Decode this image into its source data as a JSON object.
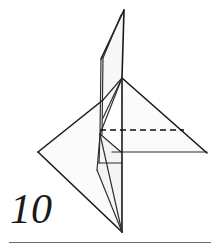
{
  "figure": {
    "step_label": "10",
    "colors": {
      "stroke": "#1a1a1a",
      "stroke_light": "#3a3a3a",
      "fill_front": "#fafafa",
      "fill_back": "#f2f2f2",
      "fill_flap": "#f7f7f7",
      "rule": "#6b6b6b",
      "background": "#ffffff"
    },
    "line_styles": {
      "solid": "edge",
      "dashed": "valley-fold"
    },
    "points": {
      "spike_tip": [
        124,
        10
      ],
      "spike_left_low": [
        101,
        59
      ],
      "apex": [
        122,
        78
      ],
      "right_tip": [
        207,
        153
      ],
      "left_tip": [
        38,
        152
      ],
      "bottom_tip": [
        122,
        232
      ],
      "inner_node": [
        100,
        134
      ],
      "inner_node_low": [
        100,
        163
      ],
      "mid_node": [
        103,
        118
      ],
      "base_right_end": [
        207,
        152
      ],
      "dashed_left": [
        100,
        130
      ],
      "dashed_right": [
        184,
        130
      ]
    },
    "shapes": [
      {
        "name": "upper-spike-flap",
        "type": "polygon",
        "fill": "fill_flap",
        "points": "124,10 101,59 100,134 103,118 122,78"
      },
      {
        "name": "right-wing-triangle",
        "type": "polygon",
        "fill": "fill_front",
        "points": "122,78 207,152 118,152"
      },
      {
        "name": "left-wing-triangle",
        "type": "polygon",
        "fill": "fill_front",
        "points": "38,152 103,100 122,232"
      },
      {
        "name": "lower-center-flap",
        "type": "polygon",
        "fill": "fill_back",
        "points": "100,134 122,152 122,232 97,170"
      }
    ],
    "edges": [
      {
        "name": "spike-right-edge",
        "from": [
          124,
          10
        ],
        "to": [
          122,
          78
        ]
      },
      {
        "name": "spike-left-edge",
        "from": [
          124,
          10
        ],
        "to": [
          101,
          59
        ]
      },
      {
        "name": "spike-left-inner",
        "from": [
          121,
          14
        ],
        "to": [
          103,
          58
        ]
      },
      {
        "name": "flap-left-vertical",
        "from": [
          101,
          59
        ],
        "to": [
          100,
          134
        ]
      },
      {
        "name": "flap-left-vertical-inner",
        "from": [
          103,
          58
        ],
        "to": [
          102,
          134
        ]
      },
      {
        "name": "center-vertical",
        "from": [
          122,
          78
        ],
        "to": [
          122,
          232
        ]
      },
      {
        "name": "apex-to-right-tip",
        "from": [
          122,
          78
        ],
        "to": [
          207,
          153
        ]
      },
      {
        "name": "apex-to-inner-node",
        "from": [
          122,
          78
        ],
        "to": [
          100,
          134
        ]
      },
      {
        "name": "apex-to-mid-node",
        "from": [
          122,
          78
        ],
        "to": [
          103,
          118
        ]
      },
      {
        "name": "apex-to-left-upper",
        "from": [
          122,
          78
        ],
        "to": [
          103,
          100
        ]
      },
      {
        "name": "left-upper-to-left-tip",
        "from": [
          103,
          100
        ],
        "to": [
          38,
          152
        ]
      },
      {
        "name": "left-tip-to-bottom",
        "from": [
          38,
          152
        ],
        "to": [
          122,
          232
        ]
      },
      {
        "name": "inner-node-to-bottom",
        "from": [
          100,
          134
        ],
        "to": [
          122,
          232
        ]
      },
      {
        "name": "inner-low-to-bottom",
        "from": [
          97,
          170
        ],
        "to": [
          122,
          232
        ]
      },
      {
        "name": "inner-small-upper",
        "from": [
          100,
          134
        ],
        "to": [
          121,
          152
        ]
      },
      {
        "name": "inner-small-lower",
        "from": [
          100,
          134
        ],
        "to": [
          99,
          163
        ]
      },
      {
        "name": "inner-small-base",
        "from": [
          99,
          163
        ],
        "to": [
          122,
          163
        ]
      },
      {
        "name": "inner-left-vertical",
        "from": [
          100,
          134
        ],
        "to": [
          97,
          170
        ]
      },
      {
        "name": "base-horizontal",
        "from": [
          112,
          152
        ],
        "to": [
          207,
          152
        ]
      },
      {
        "name": "dashed-valley-fold",
        "from": [
          100,
          130
        ],
        "to": [
          184,
          130
        ],
        "style": "dashed"
      }
    ]
  },
  "footer": {
    "rule_label": "page-divider"
  }
}
